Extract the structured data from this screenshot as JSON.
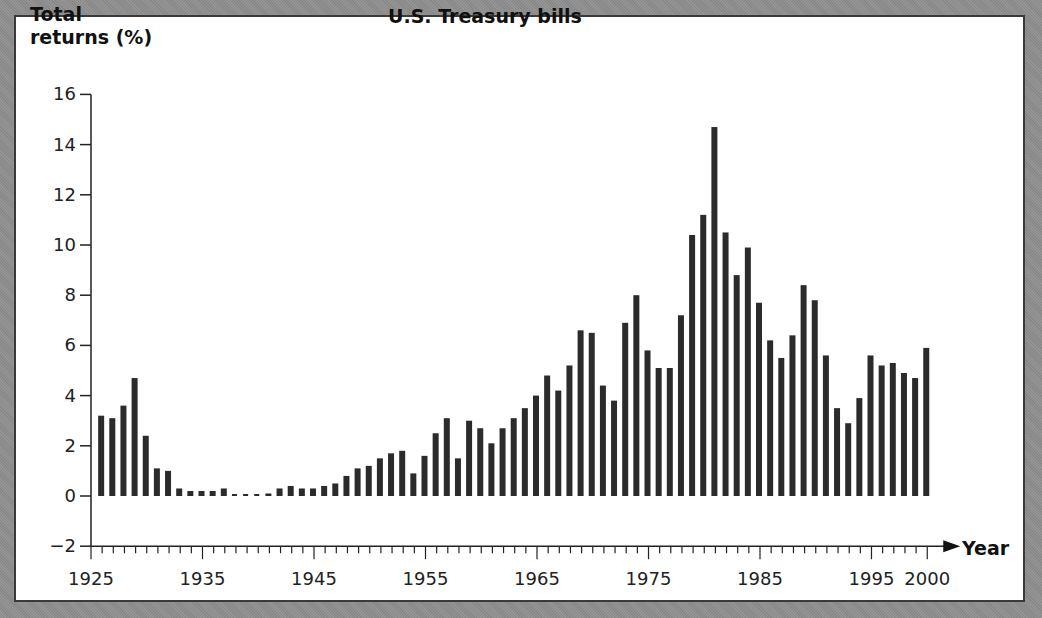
{
  "chart_data": {
    "type": "bar",
    "title": "U.S. Treasury bills",
    "xlabel": "Year",
    "ylabel": "Total returns (%)",
    "ylabel_lines": [
      "Total",
      "returns (%)"
    ],
    "ylim": [
      -2,
      16
    ],
    "yticks": [
      16,
      14,
      12,
      10,
      8,
      6,
      4,
      2,
      0,
      -2
    ],
    "ytick_labels": [
      "16",
      "14",
      "12",
      "10",
      "8",
      "6",
      "4",
      "2",
      "0",
      "−2"
    ],
    "xlim": [
      1925,
      2000
    ],
    "xtick_labels": [
      "1925",
      "1935",
      "1945",
      "1955",
      "1965",
      "1975",
      "1985",
      "1995",
      "2000"
    ],
    "xtick_values": [
      1925,
      1935,
      1945,
      1955,
      1965,
      1975,
      1985,
      1995,
      2000
    ],
    "grid": false,
    "legend": null,
    "bar_color": "#2b2b2b",
    "categories": [
      1926,
      1927,
      1928,
      1929,
      1930,
      1931,
      1932,
      1933,
      1934,
      1935,
      1936,
      1937,
      1938,
      1939,
      1940,
      1941,
      1942,
      1943,
      1944,
      1945,
      1946,
      1947,
      1948,
      1949,
      1950,
      1951,
      1952,
      1953,
      1954,
      1955,
      1956,
      1957,
      1958,
      1959,
      1960,
      1961,
      1962,
      1963,
      1964,
      1965,
      1966,
      1967,
      1968,
      1969,
      1970,
      1971,
      1972,
      1973,
      1974,
      1975,
      1976,
      1977,
      1978,
      1979,
      1980,
      1981,
      1982,
      1983,
      1984,
      1985,
      1986,
      1987,
      1988,
      1989,
      1990,
      1991,
      1992,
      1993,
      1994,
      1995,
      1996,
      1997,
      1998,
      1999,
      2000
    ],
    "values": [
      3.2,
      3.1,
      3.6,
      4.7,
      2.4,
      1.1,
      1.0,
      0.3,
      0.2,
      0.2,
      0.2,
      0.3,
      0.0,
      0.0,
      0.0,
      0.1,
      0.3,
      0.4,
      0.3,
      0.3,
      0.4,
      0.5,
      0.8,
      1.1,
      1.2,
      1.5,
      1.7,
      1.8,
      0.9,
      1.6,
      2.5,
      3.1,
      1.5,
      3.0,
      2.7,
      2.1,
      2.7,
      3.1,
      3.5,
      4.0,
      4.8,
      4.2,
      5.2,
      6.6,
      6.5,
      4.4,
      3.8,
      6.9,
      8.0,
      5.8,
      5.1,
      5.1,
      7.2,
      10.4,
      11.2,
      14.7,
      10.5,
      8.8,
      9.9,
      7.7,
      6.2,
      5.5,
      6.4,
      8.4,
      7.8,
      5.6,
      3.5,
      2.9,
      3.9,
      5.6,
      5.2,
      5.3,
      4.9,
      4.7,
      5.9
    ]
  }
}
